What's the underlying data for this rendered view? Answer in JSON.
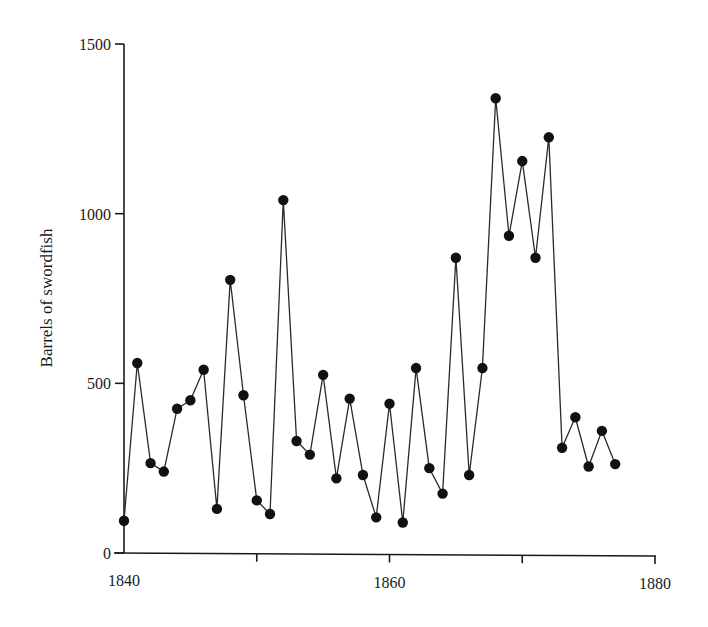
{
  "chart_data": {
    "type": "line",
    "title": "",
    "xlabel": "",
    "ylabel": "Barrels of swordfish",
    "xlim": [
      1840,
      1880
    ],
    "ylim": [
      0,
      1500
    ],
    "xticks": [
      1840,
      1850,
      1860,
      1870,
      1880
    ],
    "xtick_labels": [
      "1840",
      "",
      "1860",
      "",
      "1880"
    ],
    "yticks": [
      0,
      500,
      1000,
      1500
    ],
    "ytick_labels": [
      "0",
      "500",
      "1000",
      "1500"
    ],
    "grid": false,
    "legend": null,
    "marker": "filled-circle",
    "series": [
      {
        "name": "Barrels of swordfish",
        "x": [
          1840,
          1841,
          1842,
          1843,
          1844,
          1845,
          1846,
          1847,
          1848,
          1849,
          1850,
          1851,
          1852,
          1853,
          1854,
          1855,
          1856,
          1857,
          1858,
          1859,
          1860,
          1861,
          1862,
          1863,
          1864,
          1865,
          1866,
          1867,
          1868,
          1869,
          1870,
          1871,
          1872,
          1873,
          1874,
          1875,
          1876,
          1877
        ],
        "values": [
          95,
          560,
          265,
          240,
          425,
          450,
          540,
          130,
          805,
          465,
          155,
          115,
          1040,
          330,
          290,
          525,
          220,
          455,
          230,
          105,
          440,
          90,
          545,
          250,
          175,
          870,
          230,
          545,
          1340,
          935,
          1155,
          870,
          1225,
          310,
          400,
          255,
          360,
          262
        ]
      }
    ]
  },
  "colors": {
    "line": "#2a2a2a",
    "marker": "#111111",
    "axis": "#1a1a1a",
    "background": "#ffffff"
  }
}
